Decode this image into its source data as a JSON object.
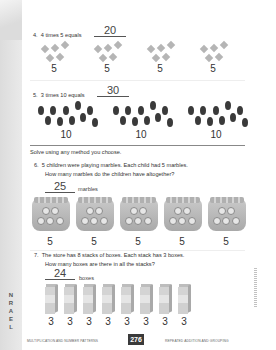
{
  "sidebar": {
    "label": "LEARN",
    "letters": [
      "L",
      "E",
      "A",
      "R",
      "N"
    ]
  },
  "problems": [
    {
      "number": "4.",
      "text": "4 times 5 equals",
      "answer": "20",
      "groups": [
        {
          "label": "5"
        },
        {
          "label": "5"
        },
        {
          "label": "5"
        },
        {
          "label": "5"
        }
      ],
      "icon": "diamond-icon"
    },
    {
      "number": "5.",
      "text": "3 times 10 equals",
      "answer": "30",
      "groups": [
        {
          "label": "10"
        },
        {
          "label": "10"
        },
        {
          "label": "10"
        }
      ],
      "icon": "dot-icon"
    }
  ],
  "instruction": "Solve using any method you choose.",
  "word_problems": [
    {
      "number": "6.",
      "line1": "5 children were playing marbles. Each child had 5 marbles.",
      "line2": "How many marbles do the children have altogether?",
      "answer": "25",
      "unit": "marbles",
      "groups": [
        {
          "label": "5"
        },
        {
          "label": "5"
        },
        {
          "label": "5"
        },
        {
          "label": "5"
        },
        {
          "label": "5"
        }
      ],
      "icon": "marble-bag-icon"
    },
    {
      "number": "7.",
      "line1": "The store has 8 stacks of boxes. Each stack has 3 boxes.",
      "line2": "How many boxes are there in all the stacks?",
      "answer": "24",
      "unit": "boxes",
      "groups": [
        {
          "label": "3"
        },
        {
          "label": "3"
        },
        {
          "label": "3"
        },
        {
          "label": "3"
        },
        {
          "label": "3"
        },
        {
          "label": "3"
        },
        {
          "label": "3"
        },
        {
          "label": "3"
        }
      ],
      "icon": "box-stack-icon"
    }
  ],
  "footer": {
    "left": "MULTIPLICATION AND NUMBER PATTERNS",
    "page": "276",
    "right": "REPEATED ADDITION AND GROUPING"
  }
}
